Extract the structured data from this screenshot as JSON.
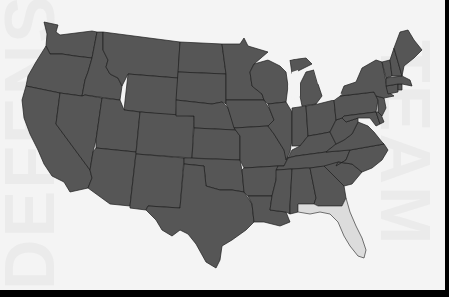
{
  "map": {
    "title": "",
    "region": "Contiguous United States",
    "colors": {
      "background": "#f4f4f4",
      "state_fill": "#565656",
      "state_border": "#1e1e1e",
      "highlight_fill": "#dcdcdc",
      "frame": "#000000"
    },
    "highlighted_states": [
      "Florida"
    ],
    "watermark_text": [
      "TEAM",
      "DEFENSE"
    ]
  }
}
